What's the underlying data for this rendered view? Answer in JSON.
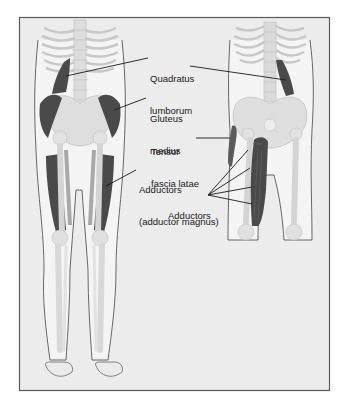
{
  "figure": {
    "frame_color": "#5a5a5a",
    "background_color": "#ececec",
    "muscle_color": "#4a4a4a",
    "bone_color": "#d9d9d9",
    "views": [
      "posterior-view",
      "anterior-view"
    ]
  },
  "labels": {
    "quadratus_lumborum": {
      "line1": "Quadratus",
      "line2": "lumborum"
    },
    "gluteus_medius": {
      "line1": "Gluteus",
      "line2": "medius"
    },
    "tensor_fascia_latae": {
      "line1": "Tensor",
      "line2": "fascia latae"
    },
    "adductors_magnus": {
      "line1": "Adductors",
      "line2": "(adductor magnus)"
    },
    "adductors": {
      "line1": "Adductors"
    }
  }
}
